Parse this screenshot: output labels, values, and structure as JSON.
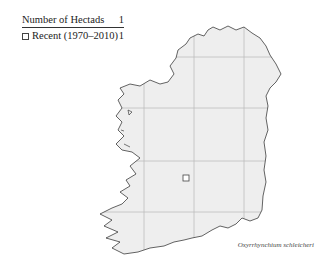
{
  "legend": {
    "header_label": "Number of Hectads",
    "header_count": "1",
    "rows": [
      {
        "symbol": "open-square",
        "label": "Recent  (1970–2010)",
        "count": "1"
      }
    ]
  },
  "map": {
    "region": "Ireland",
    "land_color": "#eeeeee",
    "coast_color": "#222222",
    "grid_color": "#bbbbbb",
    "grid_vertical_x": [
      144,
      194,
      244
    ],
    "grid_horizontal_y": [
      57,
      108,
      161,
      212
    ],
    "records": [
      {
        "type": "recent",
        "x": 186,
        "y": 178
      }
    ]
  },
  "species_name": "Oxyrrhynchium schleicheri"
}
